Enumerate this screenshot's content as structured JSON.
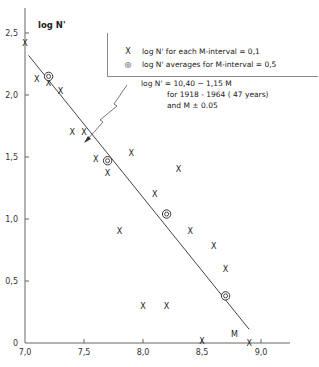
{
  "chart_data": {
    "type": "scatter",
    "title": "",
    "xlabel": "M",
    "ylabel": "log N'",
    "xlim": [
      7.0,
      9.25
    ],
    "ylim": [
      0,
      2.6
    ],
    "x_ticks": [
      "7,0",
      "7,5",
      "8,0",
      "8,5",
      "9,0"
    ],
    "y_ticks": [
      "0",
      "0,5",
      "1,0",
      "1,5",
      "2,0",
      "2,5"
    ],
    "grid": false,
    "legend_position": "upper right",
    "series": [
      {
        "name": "log N' for each M-interval = 0,1",
        "marker": "x",
        "points": [
          [
            7.0,
            2.42
          ],
          [
            7.1,
            2.13
          ],
          [
            7.2,
            2.1
          ],
          [
            7.3,
            2.03
          ],
          [
            7.4,
            1.7
          ],
          [
            7.5,
            1.7
          ],
          [
            7.6,
            1.48
          ],
          [
            7.7,
            1.37
          ],
          [
            7.8,
            0.9
          ],
          [
            7.9,
            1.53
          ],
          [
            8.0,
            0.3
          ],
          [
            8.1,
            1.2
          ],
          [
            8.2,
            0.3
          ],
          [
            8.3,
            1.4
          ],
          [
            8.4,
            0.9
          ],
          [
            8.5,
            0.02
          ],
          [
            8.6,
            0.78
          ],
          [
            8.7,
            0.6
          ],
          [
            8.9,
            0.0
          ]
        ]
      },
      {
        "name": "log N' averages for M-interval = 0,5",
        "marker": "double-circle",
        "points": [
          [
            7.2,
            2.15
          ],
          [
            7.7,
            1.47
          ],
          [
            8.2,
            1.04
          ],
          [
            8.7,
            0.38
          ]
        ]
      },
      {
        "name": "fit line log N' = 10,40 - 1,15 M",
        "type": "line",
        "points": [
          [
            7.03,
            2.32
          ],
          [
            8.9,
            0.11
          ]
        ]
      }
    ],
    "annotations": [
      "log N' = 10,40 - 1,15 M",
      "for 1918 - 1964 (47 years)",
      "and M ± 0.05"
    ]
  },
  "axis": {
    "y_title": "log N'",
    "x_title": "M"
  },
  "legend": {
    "items": [
      {
        "symbol": "X",
        "label": "log N' for each  M-interval = 0,1"
      },
      {
        "symbol": "◎",
        "label": "log N' averages for  M-interval = 0,5"
      }
    ]
  },
  "annotation": {
    "line1": "log N' = 10,40 − 1,15 M",
    "line2": "for  1918 - 1964 ( 47 years)",
    "line3": "and M ± 0.05"
  }
}
